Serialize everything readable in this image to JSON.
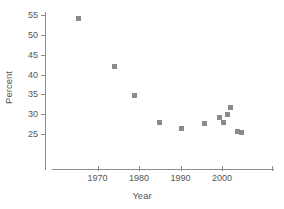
{
  "chart_data": {
    "type": "scatter",
    "title": "",
    "xlabel": "Year",
    "ylabel": "Percent",
    "xlim": [
      1961,
      2014
    ],
    "ylim": [
      22.5,
      56.5
    ],
    "grid": false,
    "legend": null,
    "marker": {
      "shape": "square",
      "color": "#8a8a8a",
      "size": 5
    },
    "x_ticks": [
      {
        "value": 1970,
        "label": "1970"
      },
      {
        "value": 1980,
        "label": "1980"
      },
      {
        "value": 1990,
        "label": "1990"
      },
      {
        "value": 2000,
        "label": "2000"
      },
      {
        "value": 2012,
        "label": ""
      }
    ],
    "y_ticks": [
      {
        "value": 25,
        "label": "25"
      },
      {
        "value": 30,
        "label": "30"
      },
      {
        "value": 35,
        "label": "35"
      },
      {
        "value": 40,
        "label": "40"
      },
      {
        "value": 45,
        "label": "45"
      },
      {
        "value": 50,
        "label": "50"
      },
      {
        "value": 55,
        "label": "55"
      }
    ],
    "x": [
      1965.5,
      1974.0,
      1979.0,
      1985.0,
      1990.3,
      1995.7,
      1999.5,
      2000.3,
      2001.3,
      2002.0,
      2003.8,
      2004.8
    ],
    "y": [
      54.2,
      42.0,
      34.8,
      27.8,
      26.3,
      27.6,
      29.2,
      27.8,
      30.0,
      31.8,
      25.7,
      25.3
    ],
    "points": [
      {
        "x": 1965.5,
        "y": 54.2
      },
      {
        "x": 1974.0,
        "y": 42.0
      },
      {
        "x": 1979.0,
        "y": 34.8
      },
      {
        "x": 1985.0,
        "y": 27.8
      },
      {
        "x": 1990.3,
        "y": 26.3
      },
      {
        "x": 1995.7,
        "y": 27.6
      },
      {
        "x": 1999.5,
        "y": 29.2
      },
      {
        "x": 2000.3,
        "y": 27.8
      },
      {
        "x": 2001.3,
        "y": 30.0
      },
      {
        "x": 2002.0,
        "y": 31.8
      },
      {
        "x": 2003.8,
        "y": 25.7
      },
      {
        "x": 2004.8,
        "y": 25.3
      }
    ]
  },
  "colors": {
    "marker": "#8a8a8a",
    "axis": "#8c8c8c",
    "text": "#555555",
    "background": "#ffffff"
  }
}
